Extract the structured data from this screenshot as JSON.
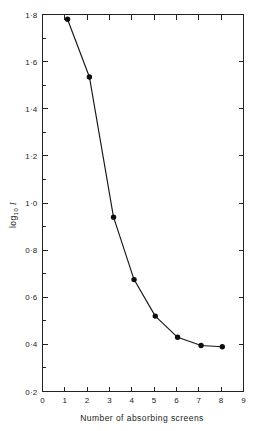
{
  "figure": {
    "background_color": "#ffffff",
    "line_color": "#161616",
    "marker_color": "#0d0d0d",
    "axis_color": "#222222"
  },
  "axis_titles": {
    "x": "Number of absorbing screens",
    "y_main": "log",
    "y_sub": "10",
    "y_var": "I"
  },
  "ticks": {
    "x_labels": [
      "0",
      "1",
      "2",
      "3",
      "4",
      "5",
      "6",
      "7",
      "8",
      "9"
    ],
    "y_labels": [
      "0·2",
      "0·4",
      "0·6",
      "0·8",
      "1·0",
      "1·2",
      "1·4",
      "1·6",
      "1·8"
    ]
  },
  "chart_data": {
    "type": "line",
    "title": "",
    "subtitle": "",
    "xlabel": "Number of absorbing screens",
    "ylabel": "log10 I",
    "xlim": [
      0,
      9
    ],
    "ylim": [
      0.2,
      1.8
    ],
    "x_tick_values": [
      0,
      1,
      2,
      3,
      4,
      5,
      6,
      7,
      8,
      9
    ],
    "y_tick_values": [
      0.2,
      0.4,
      0.6,
      0.8,
      1.0,
      1.2,
      1.4,
      1.6,
      1.8
    ],
    "y_minor_tick_values": [
      0.3,
      0.5,
      0.7,
      0.9,
      1.1,
      1.3,
      1.5,
      1.7
    ],
    "grid": false,
    "legend": null,
    "markers": "filled-circle",
    "series": [
      {
        "name": "log10 I",
        "x": [
          1.12,
          2.1,
          3.18,
          4.1,
          5.05,
          6.05,
          7.1,
          8.05
        ],
        "values": [
          1.78,
          1.535,
          0.94,
          0.675,
          0.52,
          0.43,
          0.395,
          0.39
        ]
      }
    ],
    "annotations": []
  }
}
